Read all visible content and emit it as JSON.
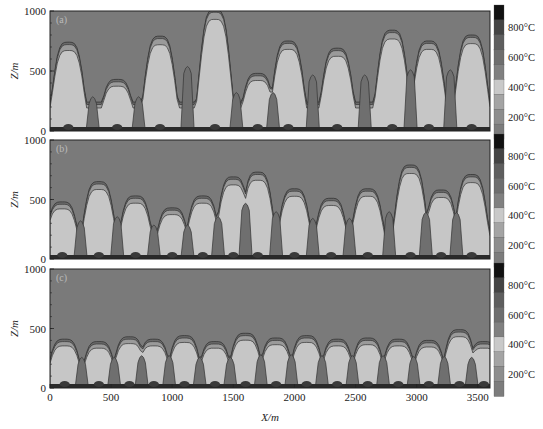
{
  "chart_data": {
    "type": "heatmap",
    "title": "",
    "xlabel": "X/m",
    "ylabel": "Z/m",
    "xlim": [
      0,
      3600
    ],
    "ylim": [
      0,
      1000
    ],
    "x_ticks": [
      "0",
      "500",
      "1000",
      "1500",
      "2000",
      "2500",
      "3000",
      "3500"
    ],
    "x_tick_values": [
      0,
      500,
      1000,
      1500,
      2000,
      2500,
      3000,
      3500
    ],
    "y_ticks": [
      "0",
      "500",
      "1000"
    ],
    "y_tick_values": [
      0,
      500,
      1000
    ],
    "colorbar": {
      "labels": [
        "800°C",
        "600°C",
        "400°C",
        "200°C"
      ],
      "label_values": [
        800,
        600,
        400,
        200
      ],
      "levels": [
        {
          "value": 900,
          "color": "#111111"
        },
        {
          "value": 800,
          "color": "#444444"
        },
        {
          "value": 700,
          "color": "#5e5e5e"
        },
        {
          "value": 600,
          "color": "#6e6e6e"
        },
        {
          "value": 500,
          "color": "#808080"
        },
        {
          "value": 400,
          "color": "#c9c9c9"
        },
        {
          "value": 300,
          "color": "#a4a4a4"
        },
        {
          "value": 200,
          "color": "#8d8d8d"
        },
        {
          "value": 100,
          "color": "#7c7c7c"
        }
      ]
    },
    "background_color": "#7a7a7a",
    "plume_light_color": "#c6c6c6",
    "plume_mid_color": "#9a9a9a",
    "plume_dark_color": "#6f6f6f",
    "panels": [
      {
        "label": "(a)",
        "plume_tops_m": [
          {
            "x": 150,
            "top": 730
          },
          {
            "x": 550,
            "top": 420
          },
          {
            "x": 900,
            "top": 780
          },
          {
            "x": 1350,
            "top": 1000
          },
          {
            "x": 1700,
            "top": 470
          },
          {
            "x": 1950,
            "top": 740
          },
          {
            "x": 2350,
            "top": 680
          },
          {
            "x": 2800,
            "top": 830
          },
          {
            "x": 3100,
            "top": 740
          },
          {
            "x": 3450,
            "top": 790
          }
        ]
      },
      {
        "label": "(b)",
        "plume_tops_m": [
          {
            "x": 100,
            "top": 470
          },
          {
            "x": 400,
            "top": 640
          },
          {
            "x": 700,
            "top": 520
          },
          {
            "x": 1000,
            "top": 420
          },
          {
            "x": 1250,
            "top": 520
          },
          {
            "x": 1500,
            "top": 680
          },
          {
            "x": 1700,
            "top": 720
          },
          {
            "x": 2000,
            "top": 580
          },
          {
            "x": 2300,
            "top": 500
          },
          {
            "x": 2600,
            "top": 580
          },
          {
            "x": 2950,
            "top": 780
          },
          {
            "x": 3200,
            "top": 570
          },
          {
            "x": 3450,
            "top": 700
          }
        ]
      },
      {
        "label": "(c)",
        "plume_tops_m": [
          {
            "x": 120,
            "top": 400
          },
          {
            "x": 400,
            "top": 380
          },
          {
            "x": 650,
            "top": 420
          },
          {
            "x": 850,
            "top": 400
          },
          {
            "x": 1100,
            "top": 430
          },
          {
            "x": 1350,
            "top": 380
          },
          {
            "x": 1600,
            "top": 450
          },
          {
            "x": 1850,
            "top": 410
          },
          {
            "x": 2100,
            "top": 430
          },
          {
            "x": 2350,
            "top": 400
          },
          {
            "x": 2600,
            "top": 410
          },
          {
            "x": 2850,
            "top": 400
          },
          {
            "x": 3100,
            "top": 390
          },
          {
            "x": 3350,
            "top": 480
          },
          {
            "x": 3550,
            "top": 380
          }
        ]
      }
    ]
  }
}
